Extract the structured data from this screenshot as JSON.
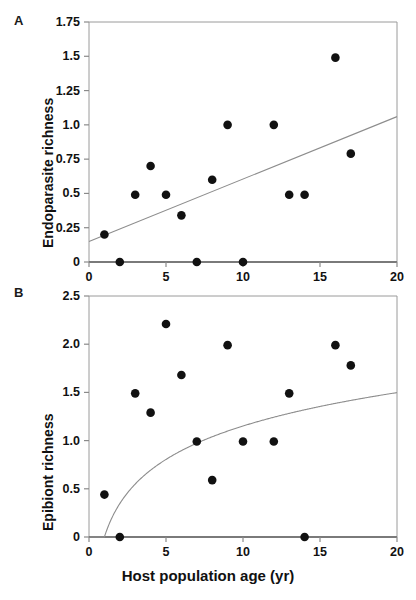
{
  "figure": {
    "xlabel": "Host population age (yr)",
    "panelA_letter": "A",
    "panelB_letter": "B"
  },
  "chart_data": [
    {
      "panel": "A",
      "type": "scatter",
      "title": "",
      "xlabel": "Host population age (yr)",
      "ylabel": "Endoparasite richness",
      "xlim": [
        0,
        20
      ],
      "ylim": [
        0,
        1.75
      ],
      "xticks": [
        0,
        5,
        10,
        15,
        20
      ],
      "xtick_labels": [
        "0",
        "5",
        "10",
        "15",
        "20"
      ],
      "yticks": [
        0,
        0.25,
        0.5,
        0.75,
        1.0,
        1.25,
        1.5,
        1.75
      ],
      "ytick_labels": [
        "0",
        "0.25",
        "0.5",
        "0.75",
        "1.0",
        "1.25",
        "1.5",
        "1.75"
      ],
      "grid": false,
      "legend": false,
      "marker": "filled-circle",
      "marker_color": "#111111",
      "points": [
        {
          "x": 1,
          "y": 0.2
        },
        {
          "x": 2,
          "y": 0.0
        },
        {
          "x": 3,
          "y": 0.49
        },
        {
          "x": 4,
          "y": 0.7
        },
        {
          "x": 5,
          "y": 0.49
        },
        {
          "x": 6,
          "y": 0.34
        },
        {
          "x": 7,
          "y": 0.0
        },
        {
          "x": 8,
          "y": 0.6
        },
        {
          "x": 9,
          "y": 1.0
        },
        {
          "x": 10,
          "y": 0.0
        },
        {
          "x": 12,
          "y": 1.0
        },
        {
          "x": 13,
          "y": 0.49
        },
        {
          "x": 14,
          "y": 0.49
        },
        {
          "x": 16,
          "y": 1.49
        },
        {
          "x": 17,
          "y": 0.79
        }
      ],
      "fit": {
        "kind": "linear",
        "color": "#8d8d8d",
        "endpoints": [
          {
            "x": 0,
            "y": 0.15
          },
          {
            "x": 20,
            "y": 1.06
          }
        ]
      }
    },
    {
      "panel": "B",
      "type": "scatter",
      "title": "",
      "xlabel": "Host population age (yr)",
      "ylabel": "Epibiont richness",
      "xlim": [
        0,
        20
      ],
      "ylim": [
        0,
        2.5
      ],
      "xticks": [
        0,
        5,
        10,
        15,
        20
      ],
      "xtick_labels": [
        "0",
        "5",
        "10",
        "15",
        "20"
      ],
      "yticks": [
        0,
        0.5,
        1.0,
        1.5,
        2.0,
        2.5
      ],
      "ytick_labels": [
        "0",
        "0.5",
        "1.0",
        "1.5",
        "2.0",
        "2.5"
      ],
      "grid": false,
      "legend": false,
      "marker": "filled-circle",
      "marker_color": "#111111",
      "points": [
        {
          "x": 1,
          "y": 0.44
        },
        {
          "x": 2,
          "y": 0.0
        },
        {
          "x": 3,
          "y": 1.49
        },
        {
          "x": 4,
          "y": 1.29
        },
        {
          "x": 5,
          "y": 2.21
        },
        {
          "x": 6,
          "y": 1.68
        },
        {
          "x": 7,
          "y": 0.99
        },
        {
          "x": 8,
          "y": 0.59
        },
        {
          "x": 9,
          "y": 1.99
        },
        {
          "x": 10,
          "y": 0.99
        },
        {
          "x": 12,
          "y": 0.99
        },
        {
          "x": 13,
          "y": 1.49
        },
        {
          "x": 14,
          "y": 0.0
        },
        {
          "x": 16,
          "y": 1.99
        },
        {
          "x": 17,
          "y": 1.78
        }
      ],
      "fit": {
        "kind": "logarithmic",
        "color": "#8d8d8d",
        "formula_a": 0.5,
        "formula_b": 0.0,
        "note": "y = 0.50 * ln(x) + 0.0"
      }
    }
  ]
}
